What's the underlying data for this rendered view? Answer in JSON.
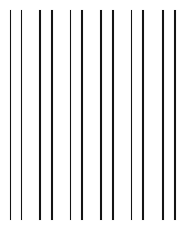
{
  "image": {
    "title": "Vertical Lines Pattern",
    "width": 192,
    "height": 232,
    "background_color": "#ffffff",
    "line_color": "#141414",
    "line_edge_color": "#787878",
    "description": "Twelve thin near-black vertical lines on a white background, grouped into six evenly spaced pairs"
  },
  "pattern": {
    "type": "vertical-lines",
    "line_count": 12,
    "group_count": 6,
    "lines_per_group": 2,
    "line_width_px": 1.6,
    "line_top_px": 10,
    "line_bottom_px": 220,
    "line_length_px": 210,
    "intra_pair_spacing_px": 11.5,
    "group_pitch_px": 30.5,
    "lines": [
      {
        "index": 1,
        "group": 1,
        "x": 10.5
      },
      {
        "index": 2,
        "group": 1,
        "x": 21.5
      },
      {
        "index": 3,
        "group": 2,
        "x": 40.0
      },
      {
        "index": 4,
        "group": 2,
        "x": 52.0
      },
      {
        "index": 5,
        "group": 3,
        "x": 70.5
      },
      {
        "index": 6,
        "group": 3,
        "x": 82.0
      },
      {
        "index": 7,
        "group": 4,
        "x": 101.0
      },
      {
        "index": 8,
        "group": 4,
        "x": 113.0
      },
      {
        "index": 9,
        "group": 5,
        "x": 131.5
      },
      {
        "index": 10,
        "group": 5,
        "x": 143.0
      },
      {
        "index": 11,
        "group": 6,
        "x": 163.0
      },
      {
        "index": 12,
        "group": 6,
        "x": 175.0
      }
    ]
  }
}
